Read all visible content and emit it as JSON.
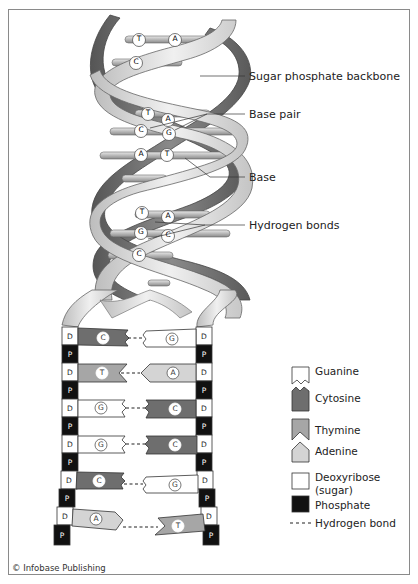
{
  "labels": {
    "backbone": "Sugar phosphate backbone",
    "base_pair": "Base pair",
    "base": "Base",
    "hydrogen_bonds": "Hydrogen bonds"
  },
  "helix_pairs": [
    {
      "left": "T",
      "right": "A"
    },
    {
      "left": "C",
      "right": ""
    },
    {
      "left": "T",
      "right": "A"
    },
    {
      "left": "C",
      "right": "G"
    },
    {
      "left": "A",
      "right": "T"
    },
    {
      "left": "T",
      "right": "A"
    },
    {
      "left": "G",
      "right": "C"
    },
    {
      "left": "C",
      "right": ""
    }
  ],
  "ladder": {
    "sugar_label": "D",
    "phosphate_label": "P",
    "rungs": [
      {
        "left": "C",
        "right": "G"
      },
      {
        "left": "T",
        "right": "A"
      },
      {
        "left": "G",
        "right": "C"
      },
      {
        "left": "G",
        "right": "C"
      },
      {
        "left": "C",
        "right": "G"
      },
      {
        "left": "A",
        "right": "T"
      }
    ]
  },
  "legend": {
    "items": [
      {
        "key": "guanine",
        "label": "Guanine"
      },
      {
        "key": "cytosine",
        "label": "Cytosine"
      },
      {
        "key": "thymine",
        "label": "Thymine"
      },
      {
        "key": "adenine",
        "label": "Adenine"
      },
      {
        "key": "deoxyribose",
        "label": "Deoxyribose",
        "label2": "(sugar)"
      },
      {
        "key": "phosphate",
        "label": "Phosphate"
      },
      {
        "key": "hbond",
        "label": "Hydrogen bond"
      }
    ]
  },
  "colors": {
    "guanine": "#ffffff",
    "cytosine": "#6e6e6e",
    "thymine": "#a6a6a6",
    "adenine": "#d4d4d4",
    "deoxyribose": "#ffffff",
    "phosphate": "#111111",
    "dark_strand": "#6a6a6a",
    "light_strand": "#d8d8d8"
  },
  "credit": "© Infobase Publishing"
}
